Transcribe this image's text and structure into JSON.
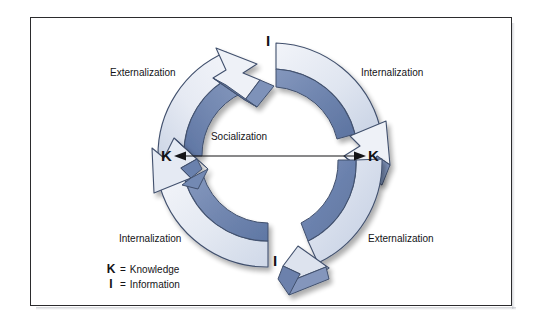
{
  "figure": {
    "title_text": "",
    "background_color": "#ffffff",
    "frame_color": "#2b2b2d"
  },
  "diagram": {
    "type": "cycle",
    "center_label": "Socialization",
    "nodes": [
      {
        "id": "top",
        "letter": "I",
        "position": "top"
      },
      {
        "id": "right",
        "letter": "K",
        "position": "right"
      },
      {
        "id": "bottom",
        "letter": "I",
        "position": "bottom"
      },
      {
        "id": "left",
        "letter": "K",
        "position": "left"
      }
    ],
    "phases": [
      {
        "id": "top-left",
        "label": "Externalization",
        "from": "left-K",
        "to": "top-I"
      },
      {
        "id": "top-right",
        "label": "Internalization",
        "from": "top-I",
        "to": "right-K"
      },
      {
        "id": "bottom-right",
        "label": "Externalization",
        "from": "right-K",
        "to": "bottom-I"
      },
      {
        "id": "bottom-left",
        "label": "Internalization",
        "from": "bottom-I",
        "to": "left-K"
      }
    ],
    "colors": {
      "arrow_light": "#dde3ee",
      "arrow_dark": "#6b82ad",
      "arrow_outline": "#3b4a66",
      "shadow": "#c7cedd",
      "text": "#141417"
    }
  },
  "legend": {
    "rows": [
      {
        "key": "K",
        "equals": "=",
        "value": "Knowledge"
      },
      {
        "key": "I",
        "equals": "=",
        "value": "Information"
      }
    ]
  }
}
